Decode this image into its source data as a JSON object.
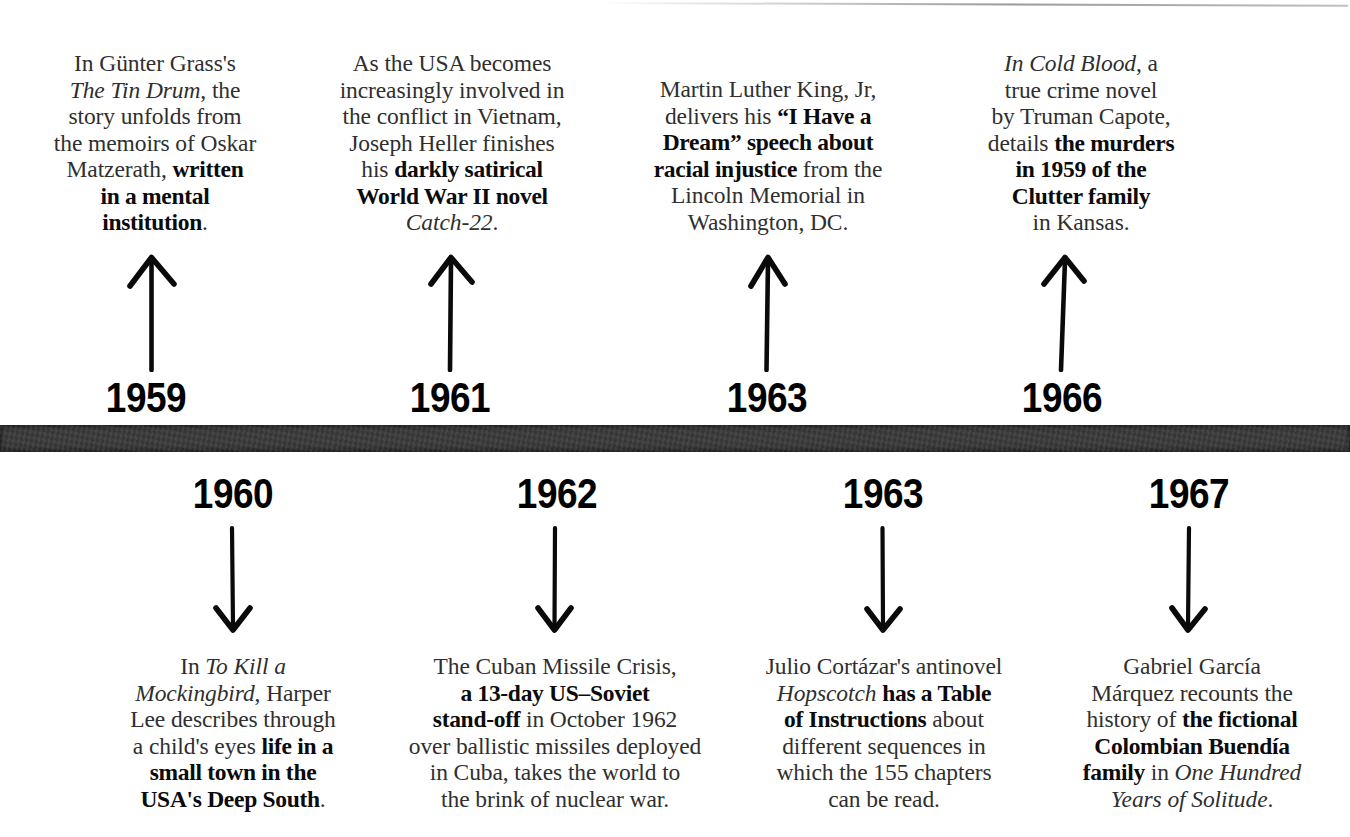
{
  "page": {
    "background_color": "#ffffff",
    "bar_color": "#3b3b3b",
    "text_color": "#2f2f2f"
  },
  "timeline": {
    "above": [
      {
        "year": "1959",
        "arrow": "up-arrow-icon",
        "text_plain": "In Günter Grass's The Tin Drum, the story unfolds from the memoirs of Oskar Matzerath, written in a mental institution.",
        "text_html": "In Günter Grass's<br><i>The Tin Drum</i>, the<br>story unfolds from<br>the memoirs of Oskar<br>Matzerath, <b>written</b><br><b>in a mental</b><br><b>institution</b>."
      },
      {
        "year": "1961",
        "arrow": "up-arrow-icon",
        "text_plain": "As the USA becomes increasingly involved in the conflict in Vietnam, Joseph Heller finishes his darkly satirical World War II novel Catch-22.",
        "text_html": "As the USA becomes<br>increasingly involved in<br>the conflict in Vietnam,<br>Joseph Heller finishes<br>his <b>darkly satirical</b><br><b>World War II novel</b><br><i>Catch-22</i>."
      },
      {
        "year": "1963",
        "arrow": "up-arrow-icon",
        "text_plain": "Martin Luther King, Jr, delivers his \"I Have a Dream\" speech about racial injustice from the Lincoln Memorial in Washington, DC.",
        "text_html": "Martin Luther King, Jr,<br>delivers his <b>&ldquo;I Have a</b><br><b>Dream&rdquo; speech about</b><br><b>racial injustice</b> from the<br>Lincoln Memorial in<br>Washington, DC."
      },
      {
        "year": "1966",
        "arrow": "up-arrow-icon",
        "text_plain": "In Cold Blood, a true crime novel by Truman Capote, details the murders in 1959 of the Clutter family in Kansas.",
        "text_html": "<i>In Cold Blood</i>, a<br>true crime novel<br>by Truman Capote,<br>details <b>the murders</b><br><b>in 1959 of the</b><br><b>Clutter family</b><br>in Kansas."
      }
    ],
    "below": [
      {
        "year": "1960",
        "arrow": "down-arrow-icon",
        "text_plain": "In To Kill a Mockingbird, Harper Lee describes through a child's eyes life in a small town in the USA's Deep South.",
        "text_html": "In <i>To Kill a</i><br><i>Mockingbird</i>, Harper<br>Lee describes through<br>a child's eyes <b>life in a</b><br><b>small town in the</b><br><b>USA's Deep South</b>."
      },
      {
        "year": "1962",
        "arrow": "down-arrow-icon",
        "text_plain": "The Cuban Missile Crisis, a 13-day US–Soviet stand-off in October 1962 over ballistic missiles deployed in Cuba, takes the world to the brink of nuclear war.",
        "text_html": "The Cuban Missile Crisis,<br><b>a 13-day US&ndash;Soviet</b><br><b>stand-off</b> in October 1962<br>over ballistic missiles deployed<br>in Cuba, takes the world to<br>the brink of nuclear war."
      },
      {
        "year": "1963",
        "arrow": "down-arrow-icon",
        "text_plain": "Julio Cortázar's antinovel Hopscotch has a Table of Instructions about different sequences in which the 155 chapters can be read.",
        "text_html": "Julio Cortázar's antinovel<br><i>Hopscotch</i> <b>has a Table</b><br><b>of Instructions</b> about<br>different sequences in<br>which the 155 chapters<br>can be read."
      },
      {
        "year": "1967",
        "arrow": "down-arrow-icon",
        "text_plain": "Gabriel García Márquez recounts the history of the fictional Colombian Buendía family in One Hundred Years of Solitude.",
        "text_html": "Gabriel García<br>Márquez recounts the<br>history of <b>the fictional</b><br><b>Colombian Buendía</b><br><b>family</b> in <i>One Hundred</i><br><i>Years of Solitude</i>."
      }
    ]
  }
}
